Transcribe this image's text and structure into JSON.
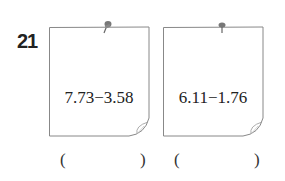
{
  "question": {
    "number": "21",
    "notes": [
      {
        "expression": "7.73−3.58"
      },
      {
        "expression": "6.11−1.76"
      }
    ],
    "answers": [
      {
        "open": "(",
        "close": ")",
        "value": ""
      },
      {
        "open": "(",
        "close": ")",
        "value": ""
      }
    ]
  }
}
